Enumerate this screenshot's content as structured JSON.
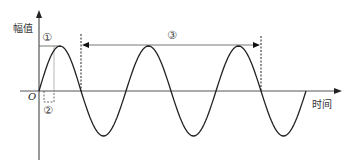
{
  "diagram": {
    "y_axis_label": "幅值",
    "x_axis_label": "时间",
    "origin_label": "O",
    "markers": {
      "m1": "①",
      "m2": "②",
      "m3": "③"
    },
    "colors": {
      "line": "#222222",
      "axis": "#333333",
      "marker_text": "#444444"
    }
  },
  "chart_data": {
    "type": "line",
    "title": "",
    "xlabel": "时间",
    "ylabel": "幅值",
    "series": [
      {
        "name": "sine",
        "function": "A*sin(2*pi*t/T)",
        "periods_shown": 3.25
      }
    ],
    "annotations": [
      {
        "id": "①",
        "meaning": "amplitude (peak height)"
      },
      {
        "id": "②",
        "meaning": "quarter/half period segment near origin"
      },
      {
        "id": "③",
        "meaning": "span of two full periods between dashed lines"
      }
    ],
    "grid": false
  }
}
